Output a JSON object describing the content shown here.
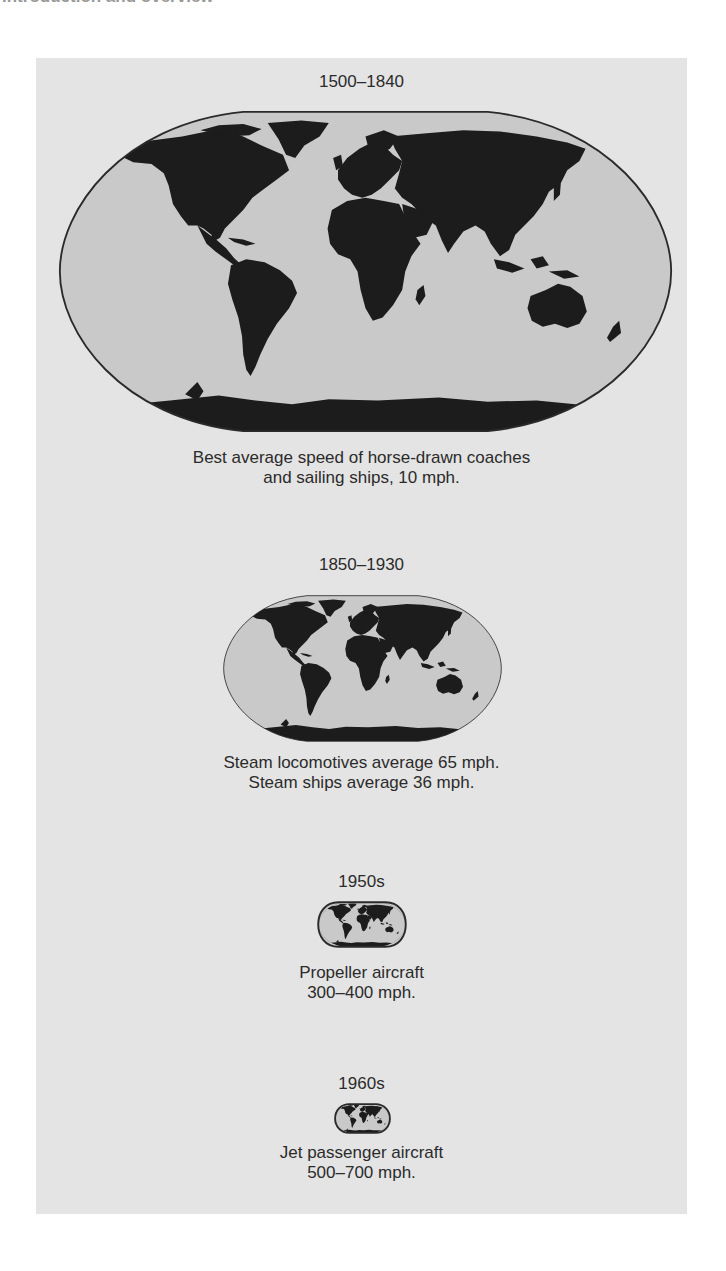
{
  "running_head": "Introduction and overview",
  "figure": {
    "colors": {
      "panel_background": "#e4e4e4",
      "ocean": "#c9c9c9",
      "land": "#1c1c1c",
      "text": "#2b2b2b"
    },
    "eras": [
      {
        "period": "1500–1840",
        "caption_lines": [
          "Best average speed of horse-drawn coaches",
          "and sailing ships, 10 mph."
        ],
        "map_size": "large"
      },
      {
        "period": "1850–1930",
        "caption_lines": [
          "Steam locomotives average 65 mph.",
          "Steam ships average 36 mph."
        ],
        "map_size": "medium"
      },
      {
        "period": "1950s",
        "caption_lines": [
          "Propeller aircraft",
          "300–400 mph."
        ],
        "map_size": "small"
      },
      {
        "period": "1960s",
        "caption_lines": [
          "Jet passenger aircraft",
          "500–700 mph."
        ],
        "map_size": "smallest"
      }
    ]
  }
}
